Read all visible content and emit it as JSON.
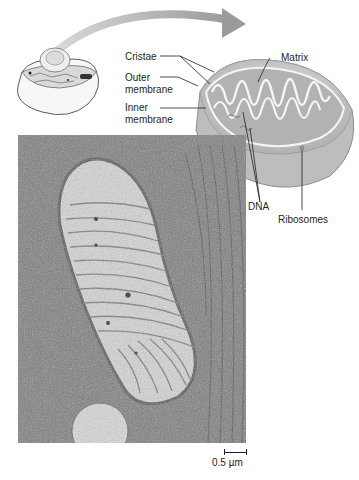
{
  "figure": {
    "labels": {
      "cristae": "Cristae",
      "matrix": "Matrix",
      "outer_membrane_line1": "Outer",
      "outer_membrane_line2": "membrane",
      "inner_membrane_line1": "Inner",
      "inner_membrane_line2": "membrane",
      "dna": "DNA",
      "ribosomes": "Ribosomes"
    },
    "scale_bar": {
      "label": "0.5 µm"
    },
    "icons": {
      "cell": "cell-illustration-icon",
      "arrow": "curved-arrow-icon",
      "mitochondrion": "mitochondrion-cutaway-icon",
      "micrograph": "electron-micrograph"
    },
    "colors": {
      "arrow": "#9a9a9a",
      "mito_outer": "#c9c9c9",
      "mito_inner": "#a8a8a8",
      "cristae": "#f4f4f4",
      "micrograph_bg": "#7d7d7d",
      "micrograph_matrix": "#d8d8d8",
      "text": "#231f20"
    }
  }
}
